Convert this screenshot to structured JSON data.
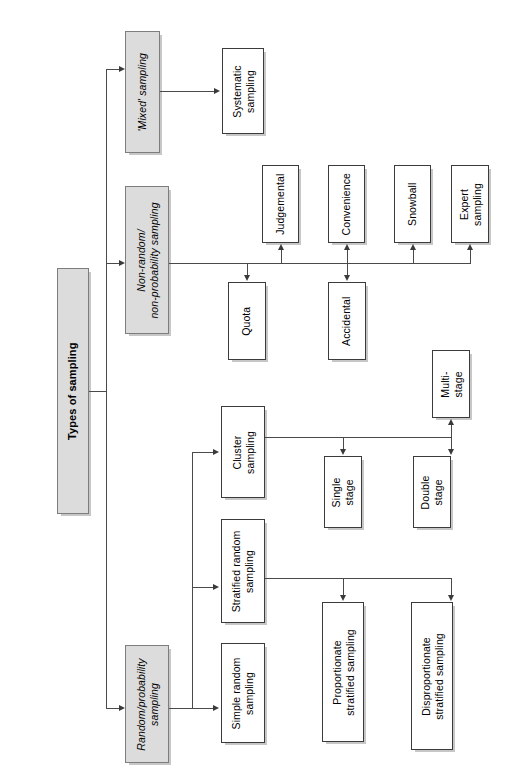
{
  "diagram": {
    "title": "Types of sampling",
    "orientation": "rotated-90-left",
    "root": {
      "label": "Types of sampling"
    },
    "level1": [
      {
        "id": "mixed",
        "label": "'Mixed' sampling"
      },
      {
        "id": "nonrandom",
        "label": "Non-random/\nnon-probability sampling"
      },
      {
        "id": "random",
        "label": "Random/probability\nsampling"
      }
    ],
    "mixed_children": [
      {
        "id": "systematic",
        "label": "Systematic\nsampling"
      }
    ],
    "nonrandom_children": [
      {
        "id": "judgemental",
        "label": "Judgemental"
      },
      {
        "id": "convenience",
        "label": "Convenience"
      },
      {
        "id": "snowball",
        "label": "Snowball"
      },
      {
        "id": "expert",
        "label": "Expert\nsampling"
      },
      {
        "id": "quota",
        "label": "Quota"
      },
      {
        "id": "accidental",
        "label": "Accidental"
      }
    ],
    "random_children": [
      {
        "id": "cluster",
        "label": "Cluster\nsampling"
      },
      {
        "id": "stratified",
        "label": "Stratified random\nsampling"
      },
      {
        "id": "simple",
        "label": "Simple random\nsampling"
      }
    ],
    "cluster_children": [
      {
        "id": "multistage",
        "label": "Multi-\nstage"
      },
      {
        "id": "singlestage",
        "label": "Single\nstage"
      },
      {
        "id": "doublestage",
        "label": "Double\nstage"
      }
    ],
    "stratified_children": [
      {
        "id": "proportionate",
        "label": "Proportionate\nstratified sampling"
      },
      {
        "id": "disproportionate",
        "label": "Disproportionate\nstratified sampling"
      }
    ],
    "colors": {
      "shaded_fill": "#dcdcdc",
      "plain_fill": "#ffffff",
      "border": "#3b3b3b",
      "line": "#4a4a4a",
      "text": "#000000",
      "background": "#ffffff"
    }
  }
}
